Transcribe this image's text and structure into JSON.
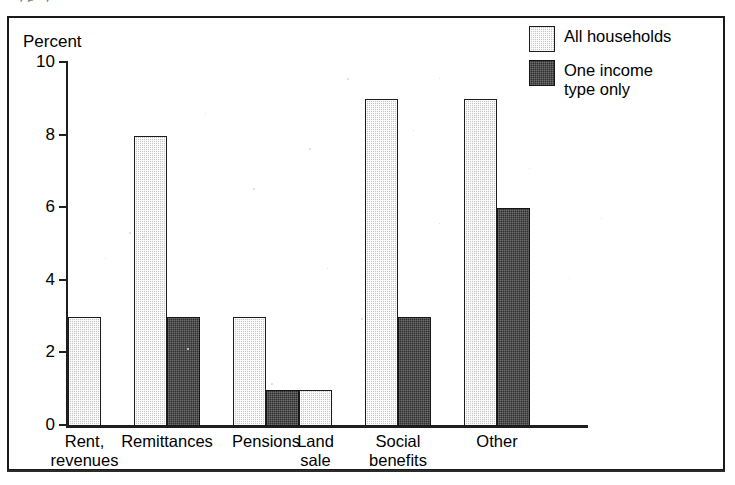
{
  "scan": {
    "caption_remnant": "yp  y"
  },
  "chart_data": {
    "type": "bar",
    "title": "",
    "xlabel": "",
    "ylabel": "Percent",
    "ylim": [
      0,
      10
    ],
    "yticks": [
      0,
      2,
      4,
      6,
      8,
      10
    ],
    "ytick_labels": [
      "0",
      "2",
      "4",
      "6",
      "8",
      "10"
    ],
    "grid": false,
    "legend_position": "top-right",
    "categories": [
      "Rent,\nrevenues",
      "Remittances",
      "Pensions",
      "Land\nsale",
      "Social\nbenefits",
      "Other"
    ],
    "series": [
      {
        "name": "All households",
        "color": "#c6c6c6",
        "values": [
          3,
          8,
          3,
          1,
          9,
          9
        ]
      },
      {
        "name": "One income\ntype only",
        "color": "#2e2e2e",
        "values": [
          null,
          3,
          1,
          null,
          3,
          6
        ]
      }
    ]
  },
  "legend": {
    "items": [
      {
        "label": "All households",
        "swatch": "light"
      },
      {
        "label": "One income\ntype only",
        "swatch": "dark"
      }
    ]
  }
}
